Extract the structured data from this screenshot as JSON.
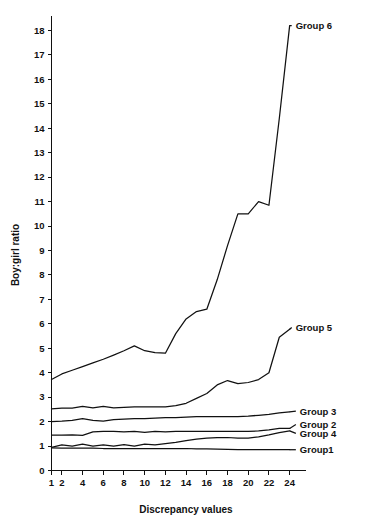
{
  "chart_data": {
    "type": "line",
    "title": "",
    "xlabel": "Discrepancy values",
    "ylabel": "Boy:girl ratio",
    "xlim": [
      1,
      25
    ],
    "ylim": [
      0,
      18.6
    ],
    "grid": false,
    "legend_position": "right-inline-labels",
    "x_ticks": [
      1,
      2,
      4,
      6,
      8,
      10,
      12,
      14,
      16,
      18,
      20,
      22,
      24
    ],
    "x_tick_labels": [
      "1",
      "2",
      "4",
      "6",
      "8",
      "10",
      "12",
      "14",
      "16",
      "18",
      "20",
      "22",
      "24"
    ],
    "y_ticks": [
      0,
      1,
      2,
      3,
      4,
      5,
      6,
      7,
      8,
      9,
      10,
      11,
      12,
      13,
      14,
      15,
      16,
      17,
      18
    ],
    "y_tick_labels": [
      "0",
      "1",
      "2",
      "3",
      "4",
      "5",
      "6",
      "7",
      "8",
      "9",
      "10",
      "11",
      "12",
      "13",
      "14",
      "15",
      "16",
      "17",
      "18"
    ],
    "x": [
      1,
      2,
      3,
      4,
      5,
      6,
      7,
      8,
      9,
      10,
      11,
      12,
      13,
      14,
      15,
      16,
      17,
      18,
      19,
      20,
      21,
      22,
      23,
      24
    ],
    "series": [
      {
        "name": "Group 6",
        "label": "Group 6",
        "label_x": 24.2,
        "label_y": 18.2,
        "values": [
          3.72,
          3.95,
          4.1,
          4.25,
          4.4,
          4.55,
          4.72,
          4.9,
          5.1,
          4.9,
          4.82,
          4.8,
          5.6,
          6.2,
          6.5,
          6.6,
          7.8,
          9.2,
          10.5,
          10.5,
          11.0,
          10.85,
          14.4,
          18.2
        ]
      },
      {
        "name": "Group 5",
        "label": "Group 5",
        "label_x": 24.2,
        "label_y": 5.85,
        "values": [
          2.52,
          2.55,
          2.55,
          2.62,
          2.56,
          2.62,
          2.56,
          2.58,
          2.6,
          2.6,
          2.6,
          2.6,
          2.65,
          2.75,
          2.95,
          3.15,
          3.5,
          3.68,
          3.55,
          3.6,
          3.72,
          4.0,
          5.45,
          5.78
        ]
      },
      {
        "name": "Group 3",
        "label": "Group 3",
        "label_x": 24.6,
        "label_y": 2.43,
        "values": [
          2.0,
          2.02,
          2.05,
          2.12,
          2.05,
          2.02,
          2.08,
          2.1,
          2.12,
          2.12,
          2.14,
          2.16,
          2.16,
          2.18,
          2.2,
          2.2,
          2.2,
          2.2,
          2.2,
          2.22,
          2.26,
          2.3,
          2.36,
          2.4
        ]
      },
      {
        "name": "Group 2",
        "label": "Group 2",
        "label_x": 24.6,
        "label_y": 1.88,
        "values": [
          1.45,
          1.45,
          1.46,
          1.44,
          1.58,
          1.6,
          1.6,
          1.58,
          1.6,
          1.56,
          1.6,
          1.58,
          1.6,
          1.6,
          1.6,
          1.6,
          1.6,
          1.6,
          1.6,
          1.6,
          1.62,
          1.66,
          1.72,
          1.72
        ]
      },
      {
        "name": "Group 4",
        "label": "Group 4",
        "label_x": 24.6,
        "label_y": 1.52,
        "values": [
          0.95,
          1.05,
          1.0,
          1.08,
          1.0,
          1.05,
          1.0,
          1.06,
          1.0,
          1.08,
          1.05,
          1.1,
          1.15,
          1.22,
          1.28,
          1.32,
          1.34,
          1.35,
          1.32,
          1.32,
          1.38,
          1.46,
          1.55,
          1.62
        ]
      },
      {
        "name": "Group1",
        "label": "Group1",
        "label_x": 24.6,
        "label_y": 0.85,
        "values": [
          0.93,
          0.92,
          0.92,
          0.92,
          0.92,
          0.9,
          0.9,
          0.9,
          0.9,
          0.9,
          0.9,
          0.9,
          0.9,
          0.9,
          0.88,
          0.88,
          0.87,
          0.86,
          0.85,
          0.85,
          0.85,
          0.85,
          0.85,
          0.85
        ]
      }
    ],
    "colors": {
      "line": "#111111",
      "axis": "#111111",
      "background": "#ffffff"
    }
  }
}
